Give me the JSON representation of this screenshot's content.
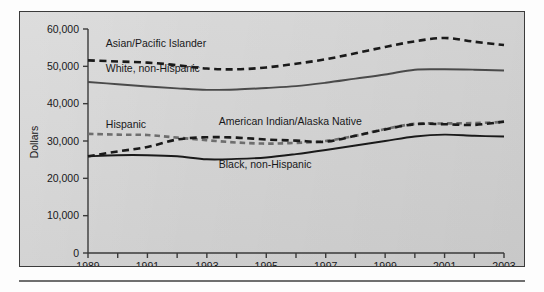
{
  "figure": {
    "background_color": "#d4d4d4",
    "border_color": "#3b3b3b",
    "rule_color": "#6f6f6f"
  },
  "chart_data": {
    "type": "line",
    "title": "",
    "xlabel": "",
    "ylabel": "Dollars",
    "xlim": [
      1989,
      2003
    ],
    "ylim": [
      0,
      60000
    ],
    "grid": false,
    "legend": "inline-labels",
    "x": [
      1989,
      1990,
      1991,
      1992,
      1993,
      1994,
      1995,
      1996,
      1997,
      1998,
      1999,
      2000,
      2001,
      2002,
      2003
    ],
    "y_ticks": [
      0,
      10000,
      20000,
      30000,
      40000,
      50000,
      60000
    ],
    "y_tick_labels": [
      "0",
      "10,000",
      "20,000",
      "30,000",
      "40,000",
      "50,000",
      "60,000"
    ],
    "x_ticks": [
      1989,
      1990,
      1991,
      1992,
      1993,
      1994,
      1995,
      1996,
      1997,
      1998,
      1999,
      2000,
      2001,
      2002,
      2003
    ],
    "x_tick_labels": [
      "1989",
      "",
      "1991",
      "",
      "1993",
      "",
      "1995",
      "",
      "1997",
      "",
      "1999",
      "",
      "2001",
      "",
      "2003"
    ],
    "x_major_labels": [
      "1989",
      "1991",
      "1993",
      "1995",
      "1997",
      "1999",
      "2001",
      "2003"
    ],
    "series": [
      {
        "name": "Asian/Pacific Islander",
        "style": "dashed",
        "color": "#1a1a1a",
        "label_x": 1989.6,
        "label_y": 55200,
        "values": [
          51600,
          51300,
          51000,
          50300,
          49400,
          49200,
          49700,
          50700,
          51900,
          53500,
          55200,
          56700,
          57600,
          56600,
          55700
        ]
      },
      {
        "name": "White, non-Hispanic",
        "style": "solid",
        "color": "#4a4a4a",
        "label_x": 1989.6,
        "label_y": 48400,
        "values": [
          45800,
          45200,
          44600,
          44100,
          43700,
          43800,
          44200,
          44700,
          45600,
          46700,
          47800,
          49100,
          49200,
          49100,
          48900
        ]
      },
      {
        "name": "Hispanic",
        "style": "dashed",
        "color": "#6e6e6e",
        "label_x": 1989.6,
        "label_y": 33600,
        "values": [
          31900,
          31700,
          31600,
          30900,
          30200,
          29600,
          29300,
          29500,
          30000,
          31400,
          33200,
          34600,
          34700,
          34800,
          35100
        ]
      },
      {
        "name": "American Indian/Alaska Native",
        "style": "dashed",
        "color": "#1a1a1a",
        "label_x": 1993.4,
        "label_y": 34300,
        "values": [
          25900,
          27200,
          28400,
          30400,
          31000,
          30900,
          30400,
          30100,
          29800,
          31400,
          33100,
          34500,
          34500,
          34300,
          35200
        ]
      },
      {
        "name": "Black, non-Hispanic",
        "style": "solid",
        "color": "#1a1a1a",
        "label_x": 1993.4,
        "label_y": 22700,
        "values": [
          25900,
          26200,
          26200,
          25900,
          25100,
          25200,
          25600,
          26500,
          27600,
          28800,
          30000,
          31200,
          31700,
          31400,
          31200
        ]
      }
    ]
  }
}
